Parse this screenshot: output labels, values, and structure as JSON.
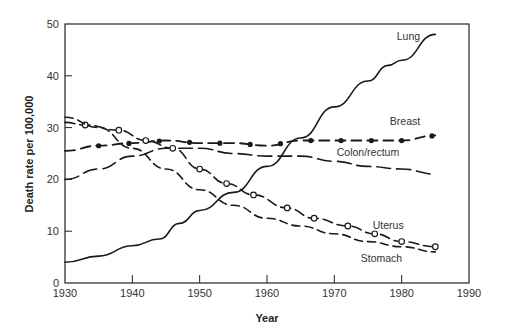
{
  "chart_data": {
    "type": "line",
    "title": "",
    "xlabel": "Year",
    "ylabel": "Death rate per 100,000",
    "xlim": [
      1930,
      1990
    ],
    "ylim": [
      0,
      50
    ],
    "x_ticks": [
      1930,
      1940,
      1950,
      1960,
      1970,
      1980,
      1990
    ],
    "y_ticks": [
      0,
      10,
      20,
      30,
      40,
      50
    ],
    "grid": false,
    "legend": "inline labels",
    "series": [
      {
        "name": "Lung",
        "style": "solid",
        "x": [
          1930,
          1935,
          1940,
          1944,
          1947,
          1950,
          1955,
          1960,
          1965,
          1970,
          1975,
          1978,
          1980,
          1985
        ],
        "y": [
          4,
          5.2,
          7.2,
          8.5,
          11.5,
          14,
          17.5,
          22.5,
          28,
          34,
          39,
          42,
          43,
          48
        ]
      },
      {
        "name": "Breast",
        "style": "dash-dot",
        "x": [
          1930,
          1935,
          1940,
          1945,
          1950,
          1955,
          1960,
          1965,
          1970,
          1975,
          1980,
          1985
        ],
        "y": [
          25.5,
          26.5,
          27,
          27.5,
          27,
          27,
          26.5,
          27.5,
          27.5,
          27.5,
          27.5,
          28.5
        ]
      },
      {
        "name": "Colon/rectum",
        "style": "long-dash",
        "x": [
          1930,
          1935,
          1940,
          1945,
          1950,
          1955,
          1960,
          1965,
          1970,
          1975,
          1980,
          1985
        ],
        "y": [
          20,
          22,
          24.5,
          26,
          26,
          25,
          24.5,
          24.5,
          23.5,
          22.5,
          22,
          21
        ]
      },
      {
        "name": "Uterus",
        "style": "dash-open-circle",
        "x": [
          1930,
          1933,
          1938,
          1942,
          1946,
          1950,
          1954,
          1958,
          1963,
          1967,
          1972,
          1976,
          1980,
          1985
        ],
        "y": [
          31,
          30.5,
          29.5,
          27.5,
          26,
          22,
          19.2,
          17,
          14.5,
          12.5,
          11,
          9.5,
          8,
          7
        ]
      },
      {
        "name": "Stomach",
        "style": "short-dash",
        "x": [
          1930,
          1935,
          1940,
          1945,
          1950,
          1955,
          1960,
          1965,
          1970,
          1975,
          1980,
          1985
        ],
        "y": [
          32,
          30,
          26,
          22,
          18,
          15,
          12.5,
          11,
          9.5,
          8,
          7,
          6
        ]
      }
    ],
    "annotations": [
      {
        "text": "Lung",
        "x": 1981,
        "y": 47
      },
      {
        "text": "Breast",
        "x": 1980.5,
        "y": 30.5
      },
      {
        "text": "Colon/rectum",
        "x": 1975,
        "y": 24.5
      },
      {
        "text": "Uterus",
        "x": 1978,
        "y": 10.5
      },
      {
        "text": "Stomach",
        "x": 1977,
        "y": 4
      }
    ]
  }
}
